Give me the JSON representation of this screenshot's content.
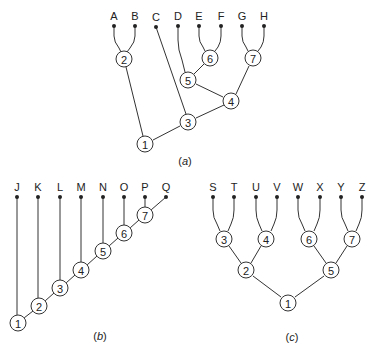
{
  "colors": {
    "line": "#333333",
    "text": "#222222",
    "background": "#ffffff"
  },
  "trees": [
    {
      "id": "a",
      "caption": {
        "open": "(",
        "letter": "a",
        "close": ")",
        "x": 185,
        "y": 165
      },
      "leaves": [
        {
          "label": "A",
          "x": 114,
          "y": 26
        },
        {
          "label": "B",
          "x": 135,
          "y": 26
        },
        {
          "label": "C",
          "x": 156,
          "y": 27
        },
        {
          "label": "D",
          "x": 178,
          "y": 26
        },
        {
          "label": "E",
          "x": 199,
          "y": 26
        },
        {
          "label": "F",
          "x": 221,
          "y": 26
        },
        {
          "label": "G",
          "x": 242,
          "y": 26
        },
        {
          "label": "H",
          "x": 264,
          "y": 26
        }
      ],
      "nodes": [
        {
          "label": "1",
          "x": 145,
          "y": 144
        },
        {
          "label": "2",
          "x": 124,
          "y": 59
        },
        {
          "label": "3",
          "x": 188,
          "y": 122
        },
        {
          "label": "4",
          "x": 231,
          "y": 101
        },
        {
          "label": "5",
          "x": 188,
          "y": 80
        },
        {
          "label": "6",
          "x": 210,
          "y": 58
        },
        {
          "label": "7",
          "x": 253,
          "y": 58
        }
      ],
      "edges": [
        {
          "path": "M114 26 L114 36 Q114 42 119 48 L121 52"
        },
        {
          "path": "M135 26 L135 36 Q135 42 130 48 L127 52"
        },
        {
          "path": "M156 27 L186 114"
        },
        {
          "path": "M178 26 L178 40 Q178 50 182 60 L185 72"
        },
        {
          "path": "M199 26 L199 36 Q199 42 203 47 L205 51"
        },
        {
          "path": "M221 26 L221 36 Q221 42 218 47 L215 51"
        },
        {
          "path": "M242 26 L242 36 Q242 42 246 47 L248 51"
        },
        {
          "path": "M264 26 L264 36 Q264 42 261 47 L258 51"
        },
        {
          "path": "M126 67 L143 136"
        },
        {
          "path": "M204 64 L194 74"
        },
        {
          "path": "M196 84 L223 97"
        },
        {
          "path": "M249 66 L236 94"
        },
        {
          "path": "M224 105 L196 118"
        },
        {
          "path": "M180 126 L153 140"
        }
      ]
    },
    {
      "id": "b",
      "caption": {
        "open": "(",
        "letter": "b",
        "close": ")",
        "x": 100,
        "y": 340
      },
      "leaves": [
        {
          "label": "J",
          "x": 17,
          "y": 197
        },
        {
          "label": "K",
          "x": 38,
          "y": 197
        },
        {
          "label": "L",
          "x": 60,
          "y": 197
        },
        {
          "label": "M",
          "x": 81,
          "y": 197
        },
        {
          "label": "N",
          "x": 103,
          "y": 197
        },
        {
          "label": "O",
          "x": 124,
          "y": 197
        },
        {
          "label": "P",
          "x": 145,
          "y": 197
        },
        {
          "label": "Q",
          "x": 166,
          "y": 197
        }
      ],
      "nodes": [
        {
          "label": "1",
          "x": 18,
          "y": 323
        },
        {
          "label": "2",
          "x": 39,
          "y": 306
        },
        {
          "label": "3",
          "x": 60,
          "y": 288
        },
        {
          "label": "4",
          "x": 81,
          "y": 270
        },
        {
          "label": "5",
          "x": 103,
          "y": 251
        },
        {
          "label": "6",
          "x": 124,
          "y": 233
        },
        {
          "label": "7",
          "x": 145,
          "y": 215
        }
      ],
      "edges": [
        {
          "path": "M17 197 L17 315"
        },
        {
          "path": "M38 197 L38 298"
        },
        {
          "path": "M60 197 L60 280"
        },
        {
          "path": "M81 197 L81 262"
        },
        {
          "path": "M103 197 L103 243"
        },
        {
          "path": "M124 197 L124 225"
        },
        {
          "path": "M145 197 L145 207"
        },
        {
          "path": "M166 197 L151 210"
        },
        {
          "path": "M24 318 L33 311"
        },
        {
          "path": "M45 301 L54 293"
        },
        {
          "path": "M66 283 L75 275"
        },
        {
          "path": "M87 265 L97 256"
        },
        {
          "path": "M109 246 L118 238"
        },
        {
          "path": "M130 228 L139 220"
        }
      ]
    },
    {
      "id": "c",
      "caption": {
        "open": "(",
        "letter": "c",
        "close": ")",
        "x": 292,
        "y": 341
      },
      "leaves": [
        {
          "label": "S",
          "x": 213,
          "y": 197
        },
        {
          "label": "T",
          "x": 234,
          "y": 197
        },
        {
          "label": "U",
          "x": 256,
          "y": 197
        },
        {
          "label": "V",
          "x": 277,
          "y": 197
        },
        {
          "label": "W",
          "x": 298,
          "y": 197
        },
        {
          "label": "X",
          "x": 320,
          "y": 197
        },
        {
          "label": "Y",
          "x": 341,
          "y": 197
        },
        {
          "label": "Z",
          "x": 362,
          "y": 197
        }
      ],
      "nodes": [
        {
          "label": "1",
          "x": 288,
          "y": 303
        },
        {
          "label": "2",
          "x": 246,
          "y": 270
        },
        {
          "label": "3",
          "x": 224,
          "y": 239
        },
        {
          "label": "4",
          "x": 266,
          "y": 239
        },
        {
          "label": "5",
          "x": 331,
          "y": 270
        },
        {
          "label": "6",
          "x": 309,
          "y": 239
        },
        {
          "label": "7",
          "x": 352,
          "y": 239
        }
      ],
      "edges": [
        {
          "path": "M213 197 L213 210 Q213 218 217 224 L220 231"
        },
        {
          "path": "M234 197 L234 210 Q234 218 231 224 L228 231"
        },
        {
          "path": "M256 197 L256 210 Q256 218 259 224 L262 231"
        },
        {
          "path": "M277 197 L277 210 Q277 218 274 224 L271 231"
        },
        {
          "path": "M298 197 L298 210 Q298 218 302 224 L305 231"
        },
        {
          "path": "M320 197 L320 210 Q320 218 317 224 L314 231"
        },
        {
          "path": "M341 197 L341 210 Q341 218 345 224 L348 231"
        },
        {
          "path": "M362 197 L362 210 Q362 218 359 224 L356 231"
        },
        {
          "path": "M229 246 L241 263"
        },
        {
          "path": "M261 246 L251 263"
        },
        {
          "path": "M314 246 L326 263"
        },
        {
          "path": "M347 246 L336 263"
        },
        {
          "path": "M253 276 L281 297"
        },
        {
          "path": "M324 276 L295 297"
        }
      ]
    }
  ]
}
